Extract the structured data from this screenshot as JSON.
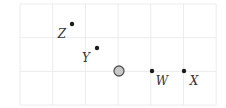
{
  "diagram": {
    "type": "coordinate-grid",
    "grid": {
      "x0": 20,
      "y0": 4,
      "cols": 6,
      "rows": 3,
      "cell_w": 32.7,
      "cell_h": 33.7,
      "line_color": "#ececec"
    },
    "origin": {
      "cx": 119,
      "cy": 71,
      "r": 5,
      "fill": "#c8c8c8",
      "stroke": "#555555"
    },
    "points": [
      {
        "name": "Z",
        "label": "Z",
        "cx": 72,
        "cy": 24,
        "lx": 62,
        "ly": 38
      },
      {
        "name": "Y",
        "label": "Y",
        "cx": 97,
        "cy": 48,
        "lx": 86,
        "ly": 62
      },
      {
        "name": "W",
        "label": "W",
        "cx": 152,
        "cy": 71,
        "lx": 162,
        "ly": 85
      },
      {
        "name": "X",
        "label": "X",
        "cx": 184,
        "cy": 71,
        "lx": 194,
        "ly": 85
      }
    ]
  }
}
